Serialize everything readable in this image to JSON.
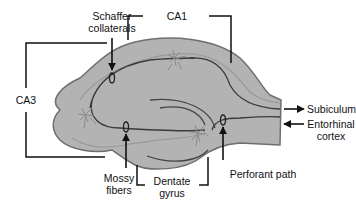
{
  "diagram": {
    "colors": {
      "tissue_fill": "#b3b3b3",
      "tissue_outline": "#6e6e6e",
      "pathway_line": "#3a3a3a",
      "neuron": "#8c8c8c",
      "label_text": "#111111",
      "bracket_line": "#111111",
      "background": "#ffffff"
    },
    "regions": {
      "ca1": "CA1",
      "ca3": "CA3",
      "dentate_line1": "Dentate",
      "dentate_line2": "gyrus"
    },
    "pathways": {
      "schaffer_line1": "Schaffer",
      "schaffer_line2": "collaterals",
      "mossy_line1": "Mossy",
      "mossy_line2": "fibers",
      "perforant": "Perforant path"
    },
    "outputs": {
      "subiculum": "Subiculum",
      "entorhinal_line1": "Entorhinal",
      "entorhinal_line2": "cortex"
    },
    "arrows": [
      {
        "name": "subiculum-arrow",
        "direction": "out"
      },
      {
        "name": "entorhinal-arrow",
        "direction": "in"
      }
    ]
  }
}
